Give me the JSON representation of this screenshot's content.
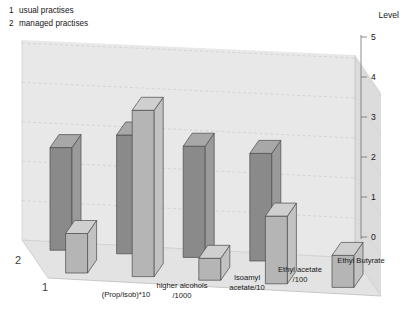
{
  "legend": {
    "entries": [
      {
        "key": "1",
        "label": "usual practises"
      },
      {
        "key": "2",
        "label": "managed practises"
      }
    ]
  },
  "axes": {
    "value_axis_title": "Level",
    "value_ticks": [
      "5",
      "4",
      "3",
      "2",
      "1",
      "0"
    ],
    "row_labels": [
      "2",
      "1"
    ]
  },
  "colors": {
    "back_wall": "#e8e8e8",
    "side_wall": "#dcdcdc",
    "floor": "#e3e3e3",
    "series_back_face": "#8a8a8a",
    "series_back_side": "#9a9a9a",
    "series_back_top": "#a8a8a8",
    "series_front_face": "#b5b5b5",
    "series_front_side": "#c2c2c2",
    "series_front_top": "#cfcfcf",
    "grid": "#cdcdcd",
    "outline": "#4a4a4a",
    "text": "#161616"
  },
  "chart_data": {
    "type": "bar",
    "title": "",
    "xlabel": "",
    "ylabel": "Level",
    "ylim": [
      0,
      5
    ],
    "grid": true,
    "legend_position": "top-left",
    "projection": "3d-grouped-rows",
    "categories": [
      "(Prop/isob)*10",
      "higher alcohols /1000",
      "Isoamyl acetate/10",
      "Ethyl acetate /100",
      "Ethyl Butyrate"
    ],
    "category_lines": [
      [
        "(Prop/isob)*10"
      ],
      [
        "higher alcohols",
        "/1000"
      ],
      [
        "Isoamyl",
        "acetate/10"
      ],
      [
        "Ethyl acetate",
        "/100"
      ],
      [
        "Ethyl Butyrate"
      ]
    ],
    "series": [
      {
        "name": "managed practises",
        "row": "2",
        "values": [
          2.6,
          3.0,
          2.8,
          2.7,
          0.0
        ]
      },
      {
        "name": "usual practises",
        "row": "1",
        "values": [
          1.0,
          4.2,
          0.55,
          1.7,
          0.8
        ]
      }
    ]
  }
}
